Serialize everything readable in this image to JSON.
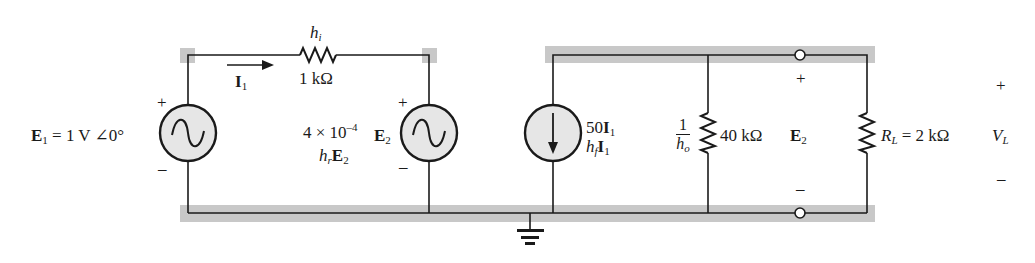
{
  "figure": {
    "colors": {
      "wire": "#1a1a1a",
      "highlight_band": "#c8c8c8",
      "source_fill": "#e6e6e6",
      "background": "#ffffff"
    },
    "input_source": {
      "name": "E",
      "subscript": "1",
      "value": "= 1 V ∠0°",
      "plus": "+",
      "minus": "–",
      "icon": "ac-sine-source"
    },
    "current_label": {
      "name": "I",
      "subscript": "1",
      "icon": "arrow-right"
    },
    "input_resistor": {
      "param": "h",
      "param_subscript": "i",
      "value": "1 kΩ"
    },
    "feedback_source": {
      "coefficient": "4 × 10",
      "exponent": "–4",
      "param": "h",
      "param_subscript": "r",
      "controlled_by": "E",
      "controlled_by_subscript": "2",
      "label_name": "E",
      "label_subscript": "2",
      "plus": "+",
      "minus": "–",
      "icon": "ac-sine-source"
    },
    "current_source": {
      "value": "50",
      "controlled_by": "I",
      "controlled_by_subscript": "1",
      "param": "h",
      "param_subscript": "f",
      "icon": "current-source-arrow-down"
    },
    "output_resistor": {
      "numerator": "1",
      "param": "h",
      "param_subscript": "o",
      "value": "40 kΩ"
    },
    "output_voltage": {
      "name": "E",
      "subscript": "2",
      "plus": "+",
      "minus": "–"
    },
    "load_resistor": {
      "name": "R",
      "subscript": "L",
      "value": "= 2 kΩ"
    },
    "load_voltage": {
      "name": "V",
      "subscript": "L",
      "plus": "+",
      "minus": "–"
    },
    "ground": {
      "icon": "ground-symbol"
    }
  }
}
